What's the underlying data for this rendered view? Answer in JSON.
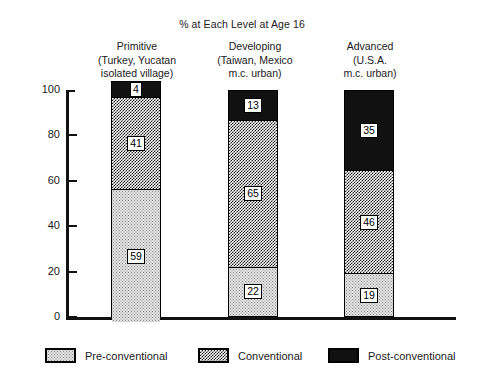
{
  "chart_data": {
    "type": "bar",
    "subtype": "stacked-100-percent",
    "title": "% at Each Level at Age 16",
    "xlabel": "",
    "ylabel": "",
    "ylim": [
      0,
      100
    ],
    "yticks": [
      0,
      20,
      40,
      60,
      80,
      100
    ],
    "ytick_labels": [
      "0",
      "20",
      "40",
      "60",
      "80",
      "100"
    ],
    "grid": false,
    "legend_position": "bottom",
    "categories": [
      "Primitive (Turkey, Yucatan isolated village)",
      "Developing (Taiwan, Mexico m.c. urban)",
      "Advanced (U.S.A. m.c. urban)"
    ],
    "category_lines": [
      [
        "Primitive",
        "(Turkey, Yucatan",
        "isolated village)"
      ],
      [
        "Developing",
        "(Taiwan, Mexico",
        "m.c. urban)"
      ],
      [
        "Advanced",
        "(U.S.A.",
        "m.c. urban)"
      ]
    ],
    "series": [
      {
        "name": "Pre-conventional",
        "fill": "light-dots",
        "values": [
          59,
          22,
          19
        ]
      },
      {
        "name": "Conventional",
        "fill": "checkerboard",
        "values": [
          41,
          65,
          46
        ]
      },
      {
        "name": "Post-conventional",
        "fill": "solid-black",
        "values": [
          4,
          13,
          35
        ]
      }
    ],
    "stack_order_top_to_bottom": [
      "Post-conventional",
      "Conventional",
      "Pre-conventional"
    ],
    "bars": [
      {
        "category": "Primitive",
        "segments": [
          {
            "level": "Post-conventional",
            "value": 4,
            "label": "4"
          },
          {
            "level": "Conventional",
            "value": 41,
            "label": "41"
          },
          {
            "level": "Pre-conventional",
            "value": 59,
            "label": "59"
          }
        ]
      },
      {
        "category": "Developing",
        "segments": [
          {
            "level": "Post-conventional",
            "value": 13,
            "label": "13"
          },
          {
            "level": "Conventional",
            "value": 65,
            "label": "65"
          },
          {
            "level": "Pre-conventional",
            "value": 22,
            "label": "22"
          }
        ]
      },
      {
        "category": "Advanced",
        "segments": [
          {
            "level": "Post-conventional",
            "value": 35,
            "label": "35"
          },
          {
            "level": "Conventional",
            "value": 46,
            "label": "46"
          },
          {
            "level": "Pre-conventional",
            "value": 19,
            "label": "19"
          }
        ]
      }
    ],
    "legend": [
      {
        "label": "Pre-conventional",
        "fill": "light-dots"
      },
      {
        "label": "Conventional",
        "fill": "checkerboard"
      },
      {
        "label": "Post-conventional",
        "fill": "solid-black"
      }
    ],
    "colors": {
      "ink": "#111111",
      "background": "#ffffff",
      "pre_conventional": "#e4e4e4",
      "conventional": "#8c8c8c",
      "post_conventional": "#111111"
    }
  }
}
